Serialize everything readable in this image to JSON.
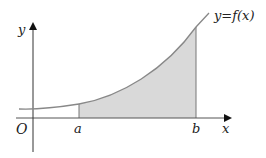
{
  "figure": {
    "curve_label": "y=f(x)",
    "x_axis_label": "x",
    "y_axis_label": "y",
    "origin_label": "O",
    "lower_bound_label": "a",
    "upper_bound_label": "b",
    "colors": {
      "curve": "#888888",
      "shade": "#d9d9d9",
      "axis": "#333333",
      "text": "#222222"
    }
  }
}
